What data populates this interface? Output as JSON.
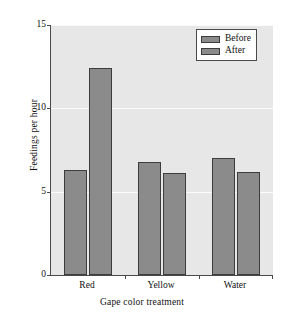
{
  "chart_data": {
    "type": "bar",
    "title": "",
    "categories": [
      "Red",
      "Yellow",
      "Water"
    ],
    "series": [
      {
        "name": "Before",
        "values": [
          6.3,
          6.8,
          7.0
        ],
        "color": "#8b8b8b"
      },
      {
        "name": "After",
        "values": [
          12.4,
          6.1,
          6.2
        ],
        "color": "#8b8b8b"
      }
    ],
    "xlabel": "Gape color treatment",
    "ylabel": "Feedings per hour",
    "ylim": [
      0,
      15
    ],
    "yticks": [
      0,
      5,
      10,
      15
    ],
    "ytick_labels": [
      "0",
      "5",
      "10",
      "15"
    ],
    "grid": "horizontal-white",
    "legend_position": "top-right",
    "legend_entries": [
      "Before",
      "After"
    ],
    "plot_background": "#e7e7e7",
    "axis_color": "#4a4a4a",
    "bar_edge_color": "#3d3d3d"
  }
}
